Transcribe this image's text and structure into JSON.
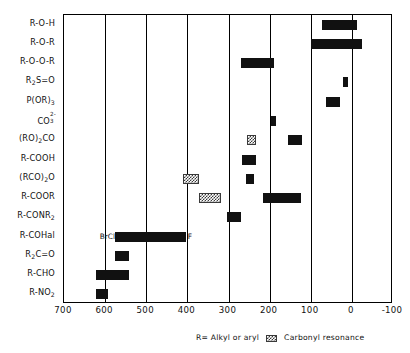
{
  "chart_data": {
    "type": "bar",
    "orientation": "horizontal",
    "title": "",
    "xlabel": "",
    "ylabel": "",
    "xlim": [
      700,
      -100
    ],
    "x_ticks": [
      700,
      600,
      500,
      400,
      300,
      200,
      100,
      0,
      -100
    ],
    "x_tick_labels": [
      "700",
      "600",
      "500",
      "400",
      "300",
      "200",
      "100",
      "0",
      "-100"
    ],
    "grid": true,
    "grid_axis": "x",
    "legend_position": "bottom-right",
    "categories": [
      "R-O-H",
      "R-O-R",
      "R-O-O-R",
      "R2S=O",
      "P(OR)3",
      "CO3 2-",
      "(RO)2CO",
      "R-COOH",
      "(RCO)2O",
      "R-COOR",
      "R-CONR2",
      "R-COHal",
      "R2C=O",
      "R-CHO",
      "R-NO2"
    ],
    "bars": [
      {
        "category": "R-O-H",
        "start": 72,
        "end": -12,
        "style": "solid"
      },
      {
        "category": "R-O-R",
        "start": 100,
        "end": -25,
        "style": "solid"
      },
      {
        "category": "R-O-O-R",
        "start": 270,
        "end": 190,
        "style": "solid"
      },
      {
        "category": "R2S=O",
        "start": 22,
        "end": 10,
        "style": "solid"
      },
      {
        "category": "P(OR)3",
        "start": 62,
        "end": 28,
        "style": "solid"
      },
      {
        "category": "CO3 2-",
        "start": 196,
        "end": 184,
        "style": "solid"
      },
      {
        "category": "(RO)2CO",
        "start": 254,
        "end": 232,
        "style": "hatch"
      },
      {
        "category": "(RO)2CO",
        "start": 156,
        "end": 122,
        "style": "solid"
      },
      {
        "category": "R-COOH",
        "start": 268,
        "end": 232,
        "style": "solid"
      },
      {
        "category": "(RCO)2O",
        "start": 410,
        "end": 372,
        "style": "hatch"
      },
      {
        "category": "(RCO)2O",
        "start": 258,
        "end": 238,
        "style": "solid"
      },
      {
        "category": "R-COOR",
        "start": 372,
        "end": 318,
        "style": "hatch"
      },
      {
        "category": "R-COOR",
        "start": 216,
        "end": 124,
        "style": "solid"
      },
      {
        "category": "R-CONR2",
        "start": 304,
        "end": 270,
        "style": "solid"
      },
      {
        "category": "R-COHal",
        "start": 576,
        "end": 404,
        "style": "solid"
      },
      {
        "category": "R2C=O",
        "start": 576,
        "end": 542,
        "style": "solid"
      },
      {
        "category": "R-CHO",
        "start": 622,
        "end": 542,
        "style": "solid"
      },
      {
        "category": "R-NO2",
        "start": 622,
        "end": 592,
        "style": "solid"
      }
    ],
    "annotations": [
      {
        "text": "BrCl",
        "value": 576,
        "category": "R-COHal",
        "align": "right"
      },
      {
        "text": "F",
        "value": 404,
        "category": "R-COHal",
        "align": "left"
      }
    ],
    "legend": [
      {
        "label": "R= Alkyl or aryl",
        "swatch": "none"
      },
      {
        "label": "Carbonyl resonance",
        "swatch": "hatch"
      }
    ]
  },
  "axis": {
    "ticks": [
      {
        "label": "700"
      },
      {
        "label": "600"
      },
      {
        "label": "500"
      },
      {
        "label": "400"
      },
      {
        "label": "300"
      },
      {
        "label": "200"
      },
      {
        "label": "100"
      },
      {
        "label": "0"
      },
      {
        "label": "-100"
      }
    ]
  },
  "rows": [
    {
      "main": "R-O-H",
      "sub": "",
      "tail": ""
    },
    {
      "main": "R-O-R",
      "sub": "",
      "tail": ""
    },
    {
      "main": "R-O-O-R",
      "sub": "",
      "tail": ""
    },
    {
      "main": "R",
      "sub": "2",
      "tail": "S=O"
    },
    {
      "main": "P(OR)",
      "sub": "3",
      "tail": ""
    },
    {
      "main": "CO",
      "sub": "3",
      "tail": "",
      "sup": "2-"
    },
    {
      "main": "(RO)",
      "sub": "2",
      "tail": "CO"
    },
    {
      "main": "R-COOH",
      "sub": "",
      "tail": ""
    },
    {
      "main": "(RCO)",
      "sub": "2",
      "tail": "O"
    },
    {
      "main": "R-COOR",
      "sub": "",
      "tail": ""
    },
    {
      "main": "R-CONR",
      "sub": "2",
      "tail": ""
    },
    {
      "main": "R-COHal",
      "sub": "",
      "tail": ""
    },
    {
      "main": "R",
      "sub": "2",
      "tail": "C=O"
    },
    {
      "main": "R-CHO",
      "sub": "",
      "tail": ""
    },
    {
      "main": "R-NO",
      "sub": "2",
      "tail": ""
    }
  ],
  "legend": {
    "r_definition": "R= Alkyl or aryl",
    "carbonyl_label": "Carbonyl resonance"
  },
  "annotations": {
    "brcl": "BrCl",
    "f": "F"
  },
  "colors": {
    "bar_solid": "#111111",
    "bar_hatch": "#3a3a3a",
    "axis": "#000000",
    "background": "#ffffff"
  }
}
